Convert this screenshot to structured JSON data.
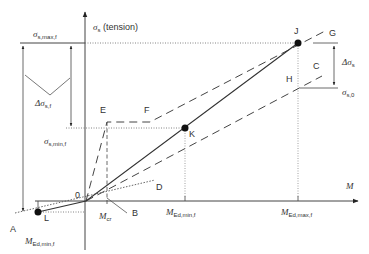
{
  "axes": {
    "y_label": "σ",
    "y_label_sub": "s",
    "y_label_suffix": " (tension)",
    "x_label": "M",
    "origin_label": "0"
  },
  "points": {
    "A": "A",
    "B": "B",
    "C": "C",
    "D": "D",
    "E": "E",
    "F": "F",
    "G": "G",
    "H": "H",
    "J": "J",
    "K": "K",
    "L": "L"
  },
  "stress_labels": {
    "sigma_max": {
      "main": "σ",
      "sub": "s,max,f"
    },
    "sigma_min": {
      "main": "σ",
      "sub": "s,min,f"
    },
    "delta_sigma_f": {
      "main": "Δσ",
      "sub": "s,f"
    },
    "delta_sigma": {
      "main": "Δσ",
      "sub": "s"
    },
    "sigma_0": {
      "main": "σ",
      "sub": "s,0"
    }
  },
  "moment_labels": {
    "m_cr": {
      "main": "M",
      "sub": "cr"
    },
    "m_ed_min": {
      "main": "M",
      "sub": "Ed,min,f"
    },
    "m_ed_max": {
      "main": "M",
      "sub": "Ed,max,f"
    },
    "m_ed_min_neg": {
      "main": "M",
      "sub": "Ed,min,f"
    }
  },
  "colors": {
    "line": "#333333",
    "dotted": "#555555",
    "text": "#333333"
  }
}
